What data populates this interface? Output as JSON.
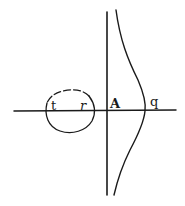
{
  "diagram": {
    "type": "geometric-curve-figure",
    "stroke_color": "#1a1a1a",
    "background": "#ffffff",
    "labels": {
      "t": "t",
      "r": "r",
      "A": "A",
      "q": "q"
    },
    "elements": [
      {
        "name": "horizontal-axis",
        "desc": "horizontal line through all figures"
      },
      {
        "name": "vertical-asymptote",
        "desc": "vertical line through point A"
      },
      {
        "name": "curve-branch",
        "desc": "curve bulging right, crossing axis at q"
      },
      {
        "name": "oval",
        "desc": "closed oval on axis between t and r, upper arc partially dashed"
      }
    ]
  }
}
